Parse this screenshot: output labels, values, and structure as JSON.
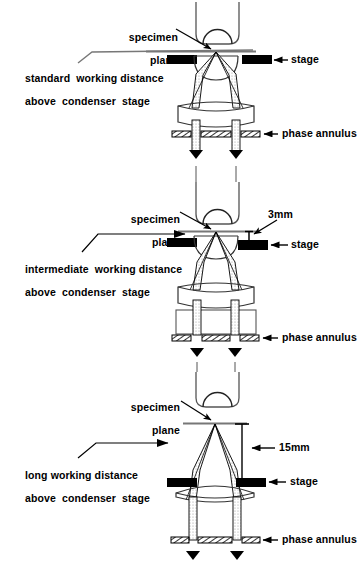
{
  "figure": {
    "type": "optical-ray-diagram",
    "panel_count": 3,
    "ink_color": "#000000",
    "background_color": "#ffffff"
  },
  "common_labels": {
    "specimen_plane": "specimen\nplane",
    "specimen_plane_line1": "specimen",
    "specimen_plane_line2": "plane",
    "stage": "stage",
    "phase_annulus": "phase annulus"
  },
  "panels": [
    {
      "id": "standard",
      "caption_line1": "standard  working distance",
      "caption_line2": "above  condenser  stage",
      "specimen_plane_label_line1": "specimen",
      "specimen_plane_label_line2": "plane",
      "stage_label": "stage",
      "annulus_label": "phase annulus",
      "dimension_label": "",
      "has_dimension": false,
      "has_spacer_block": false,
      "condenser_style": "two-lens",
      "objective": "objective-housing-with-front-lens"
    },
    {
      "id": "intermediate",
      "caption_line1": "intermediate  working distance",
      "caption_line2": "above  condenser  stage",
      "specimen_plane_label_line1": "specimen",
      "specimen_plane_label_line2": "plane",
      "stage_label": "stage",
      "annulus_label": "phase annulus",
      "dimension_label": "3mm",
      "has_dimension": true,
      "has_spacer_block": true,
      "condenser_style": "two-lens-with-spacer",
      "objective": "objective-housing-with-front-lens"
    },
    {
      "id": "long",
      "caption_line1": "long working distance",
      "caption_line2": "above  condenser  stage",
      "specimen_plane_label_line1": "specimen",
      "specimen_plane_label_line2": "plane",
      "stage_label": "stage",
      "annulus_label": "phase annulus",
      "dimension_label": "15mm",
      "has_dimension": true,
      "has_spacer_block": false,
      "condenser_style": "single-wide-lens",
      "objective": "objective-housing-with-front-lens"
    }
  ]
}
